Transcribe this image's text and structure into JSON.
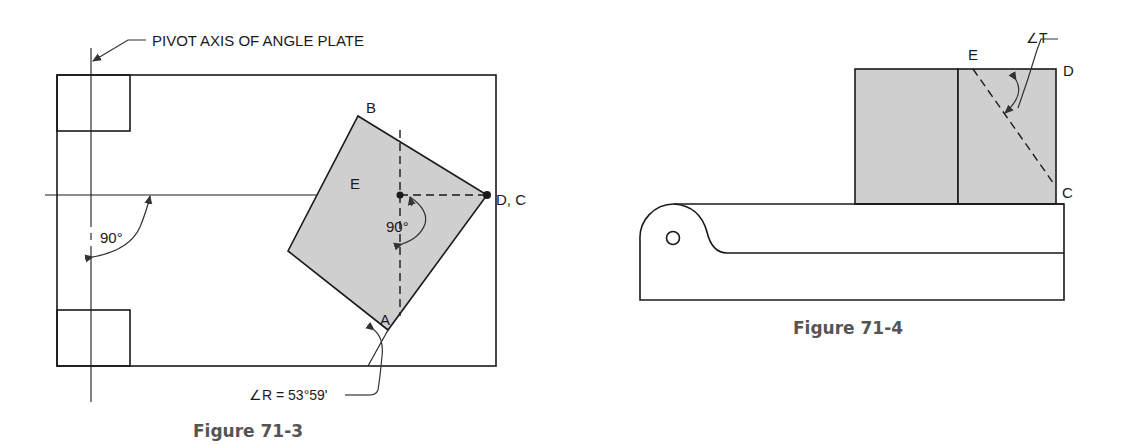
{
  "figure_71_3": {
    "caption": "Figure 71-3",
    "callout": "PIVOT AXIS OF ANGLE PLATE",
    "angle_left": "90°",
    "angle_inner": "90°",
    "angle_r": "∠R = 53°59'",
    "points": {
      "A": "A",
      "B": "B",
      "E": "E",
      "DC": "D, C"
    },
    "colors": {
      "line": "#1a1a1a",
      "shade": "#cfcfcf",
      "caption": "#555555"
    }
  },
  "figure_71_4": {
    "caption": "Figure 71-4",
    "angle_t": "∠T",
    "points": {
      "E": "E",
      "D": "D",
      "C": "C",
      "O": "O"
    },
    "colors": {
      "line": "#1a1a1a",
      "shade": "#cfcfcf",
      "caption": "#555555"
    }
  }
}
